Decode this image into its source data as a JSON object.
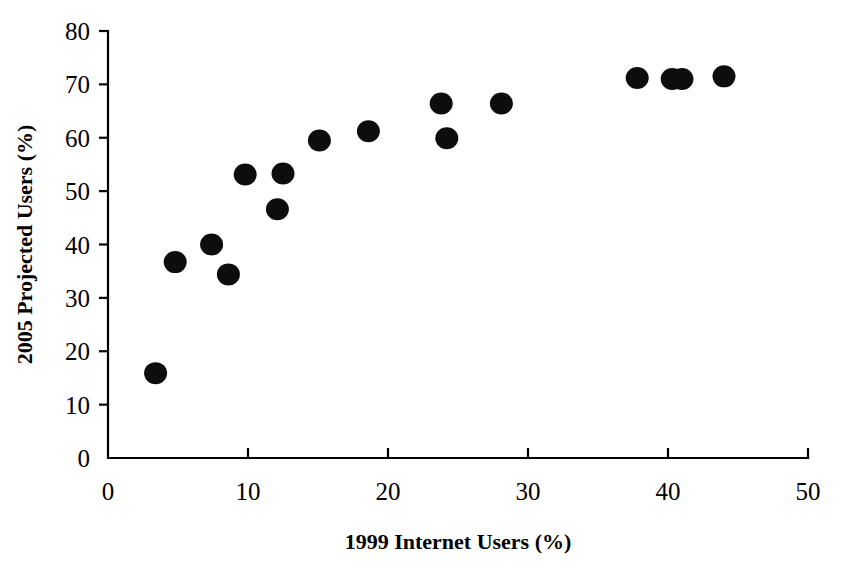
{
  "chart_data": {
    "type": "scatter",
    "title": "",
    "xlabel": "1999 Internet Users (%)",
    "ylabel": "2005 Projected Users (%)",
    "xlim": [
      0,
      50
    ],
    "ylim": [
      0,
      80
    ],
    "xticks": [
      0,
      10,
      20,
      30,
      40,
      50
    ],
    "yticks": [
      0,
      10,
      20,
      30,
      40,
      50,
      60,
      70,
      80
    ],
    "xtick_labels": [
      "0",
      "10",
      "20",
      "30",
      "40",
      "50"
    ],
    "ytick_labels": [
      "0",
      "10",
      "20",
      "30",
      "40",
      "50",
      "60",
      "70",
      "80"
    ],
    "grid": false,
    "legend": null,
    "marker": "filled-circle",
    "marker_color": "#0d0d0d",
    "points": [
      {
        "x": 3.4,
        "y": 15.9
      },
      {
        "x": 4.8,
        "y": 36.7
      },
      {
        "x": 7.4,
        "y": 40.0
      },
      {
        "x": 8.6,
        "y": 34.4
      },
      {
        "x": 9.8,
        "y": 53.1
      },
      {
        "x": 12.1,
        "y": 46.6
      },
      {
        "x": 12.5,
        "y": 53.3
      },
      {
        "x": 15.1,
        "y": 59.5
      },
      {
        "x": 18.6,
        "y": 61.2
      },
      {
        "x": 23.8,
        "y": 66.4
      },
      {
        "x": 24.2,
        "y": 59.9
      },
      {
        "x": 28.1,
        "y": 66.4
      },
      {
        "x": 37.8,
        "y": 71.2
      },
      {
        "x": 40.3,
        "y": 71.0
      },
      {
        "x": 41.0,
        "y": 71.0
      },
      {
        "x": 44.0,
        "y": 71.5
      }
    ]
  }
}
